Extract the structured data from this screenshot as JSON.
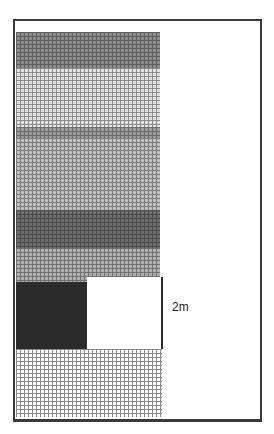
{
  "diagram": {
    "bands": [
      {
        "name": "band-1-dark-gray",
        "top": 32,
        "height": 36,
        "base": "#8a8a8a",
        "line": "#5e5e5e"
      },
      {
        "name": "band-2-light-gray",
        "top": 68,
        "height": 59,
        "base": "#e2e2e2",
        "line": "#8c8c8c"
      },
      {
        "name": "band-3-medium-gray-header",
        "top": 127,
        "height": 11,
        "base": "#9a9a9a",
        "line": "#6a6a6a"
      },
      {
        "name": "band-4-medium-gray",
        "top": 138,
        "height": 72,
        "base": "#c0c0c0",
        "line": "#7c7c7c"
      },
      {
        "name": "band-5-dark-gray",
        "top": 210,
        "height": 38,
        "base": "#6e6e6e",
        "line": "#4a4a4a"
      },
      {
        "name": "band-6-medium-gray",
        "top": 248,
        "height": 34,
        "base": "#b0b0b0",
        "line": "#707070"
      }
    ],
    "upper_right_strip": {
      "left": 87,
      "top": 248,
      "width": 73,
      "height": 29
    },
    "black_block": {
      "left": 16,
      "top": 282,
      "width": 71,
      "height": 67,
      "color": "#2b2b2b"
    },
    "white_block": {
      "left": 87,
      "top": 277,
      "width": 74,
      "height": 72,
      "color": "#ffffff"
    },
    "bottom_grid": {
      "left": 16,
      "top": 349,
      "width": 146,
      "height": 68,
      "base": "#ffffff",
      "line": "#8a8a8a"
    },
    "dimension_label": "2m"
  }
}
